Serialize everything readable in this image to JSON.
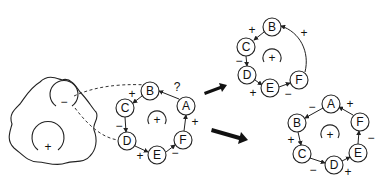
{
  "diagram": {
    "cell": {
      "inner_negative_label": "−",
      "inner_positive_label": "+"
    },
    "rings": [
      {
        "id": "initial",
        "center_label": "+",
        "nodes": [
          {
            "id": "A",
            "label": "A",
            "x": 186,
            "y": 106
          },
          {
            "id": "B",
            "label": "B",
            "x": 150,
            "y": 91
          },
          {
            "id": "C",
            "label": "C",
            "x": 125,
            "y": 108
          },
          {
            "id": "D",
            "label": "D",
            "x": 127,
            "y": 141
          },
          {
            "id": "E",
            "label": "E",
            "x": 157,
            "y": 155
          },
          {
            "id": "F",
            "label": "F",
            "x": 183,
            "y": 140
          }
        ],
        "edges": [
          {
            "from": "A",
            "to": "B",
            "sign": "?"
          },
          {
            "from": "B",
            "to": "C",
            "sign": "+"
          },
          {
            "from": "C",
            "to": "D",
            "sign": "−"
          },
          {
            "from": "D",
            "to": "E",
            "sign": "+"
          },
          {
            "from": "E",
            "to": "F",
            "sign": "−"
          },
          {
            "from": "F",
            "to": "A",
            "sign": "+"
          }
        ]
      },
      {
        "id": "outcome-1",
        "center_label": "+",
        "nodes": [
          {
            "id": "B",
            "label": "B",
            "x": 272,
            "y": 27
          },
          {
            "id": "C",
            "label": "C",
            "x": 246,
            "y": 47
          },
          {
            "id": "D",
            "label": "D",
            "x": 247,
            "y": 75
          },
          {
            "id": "E",
            "label": "E",
            "x": 270,
            "y": 88
          },
          {
            "id": "F",
            "label": "F",
            "x": 299,
            "y": 80
          }
        ],
        "edges": [
          {
            "from": "F",
            "to": "B",
            "sign": "+"
          },
          {
            "from": "B",
            "to": "C",
            "sign": "+"
          },
          {
            "from": "C",
            "to": "D",
            "sign": "−"
          },
          {
            "from": "D",
            "to": "E",
            "sign": "+"
          },
          {
            "from": "E",
            "to": "F",
            "sign": "−"
          }
        ]
      },
      {
        "id": "outcome-2",
        "center_label": "+",
        "nodes": [
          {
            "id": "A",
            "label": "A",
            "x": 331,
            "y": 104
          },
          {
            "id": "B",
            "label": "B",
            "x": 297,
            "y": 123
          },
          {
            "id": "C",
            "label": "C",
            "x": 302,
            "y": 154
          },
          {
            "id": "D",
            "label": "D",
            "x": 334,
            "y": 165
          },
          {
            "id": "E",
            "label": "E",
            "x": 358,
            "y": 153
          },
          {
            "id": "F",
            "label": "F",
            "x": 360,
            "y": 122
          }
        ],
        "edges": [
          {
            "from": "A",
            "to": "B",
            "sign": "−"
          },
          {
            "from": "B",
            "to": "C",
            "sign": "+"
          },
          {
            "from": "C",
            "to": "D",
            "sign": "−"
          },
          {
            "from": "D",
            "to": "E",
            "sign": "+"
          },
          {
            "from": "E",
            "to": "F",
            "sign": "−"
          },
          {
            "from": "F",
            "to": "A",
            "sign": "+"
          }
        ]
      }
    ],
    "arrows": [
      {
        "name": "arrow-to-outcome-1"
      },
      {
        "name": "arrow-to-outcome-2"
      }
    ]
  }
}
